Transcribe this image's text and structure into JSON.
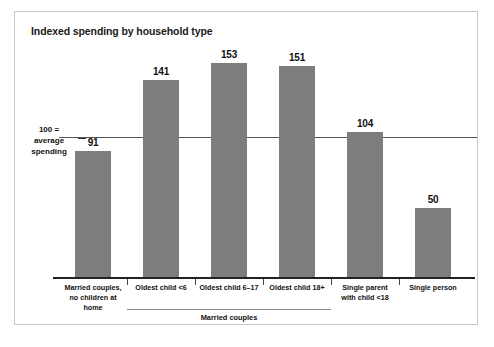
{
  "figure": {
    "title": "Indexed spending by household type",
    "axis_note_line1": "100 =",
    "axis_note_line2": "average",
    "axis_note_line3": "spending",
    "group_label": "Married couples"
  },
  "chart_data": {
    "type": "bar",
    "title": "Indexed spending by household type",
    "xlabel": "",
    "ylabel": "",
    "ylim": [
      0,
      165
    ],
    "grid": false,
    "legend": null,
    "reference_line": {
      "value": 100,
      "label": "100 = average spending"
    },
    "categories": [
      "Married couples, no children at home",
      "Oldest child <6",
      "Oldest child 6–17",
      "Oldest child 18+",
      "Single parent with child <18",
      "Single person"
    ],
    "category_labels": [
      [
        "Married couples,",
        "no children at home"
      ],
      [
        "Oldest child <6",
        ""
      ],
      [
        "Oldest child 6–17",
        ""
      ],
      [
        "Oldest child 18+",
        ""
      ],
      [
        "Single parent",
        "with child <18"
      ],
      [
        "Single person",
        ""
      ]
    ],
    "values": [
      91,
      141,
      153,
      151,
      104,
      50
    ],
    "value_labels": [
      "91",
      "141",
      "153",
      "151",
      "104",
      "50"
    ],
    "groups": [
      {
        "label": "Married couples",
        "category_indices": [
          1,
          2,
          3
        ]
      }
    ],
    "bar_color": "#7d7d7d"
  }
}
